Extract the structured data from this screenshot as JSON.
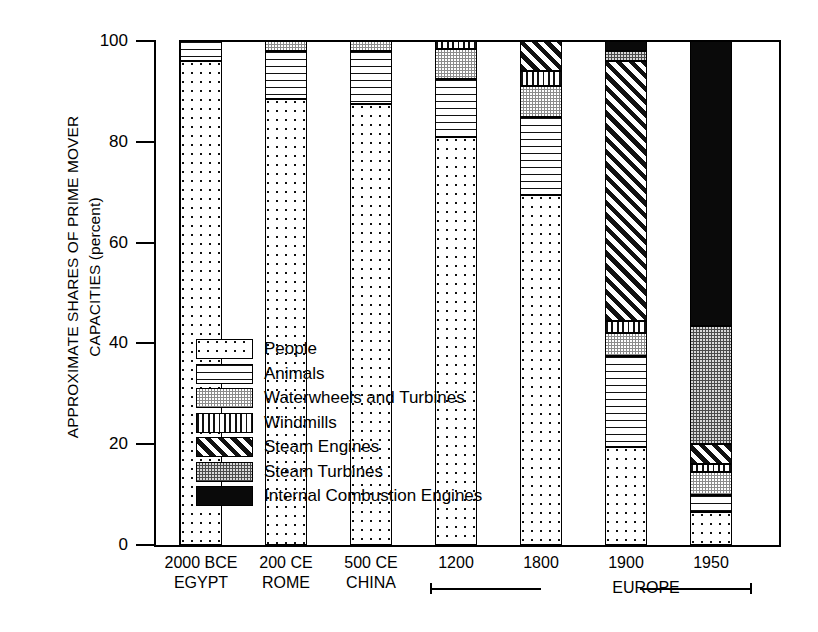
{
  "chart_data": {
    "type": "bar",
    "title": "",
    "subtype": "stacked-bar-100-percent",
    "ylabel_line1": "APPROXIMATE SHARES OF PRIME MOVER",
    "ylabel_line2": "CAPACITIES (percent)",
    "xlabel": "",
    "ylim": [
      0,
      100
    ],
    "yticks": [
      "0",
      "20",
      "40",
      "60",
      "80",
      "100"
    ],
    "grid": false,
    "legend_position": "inside-left-middle",
    "categories": [
      {
        "line1": "2000 BCE",
        "line2": "EGYPT"
      },
      {
        "line1": "200 CE",
        "line2": "ROME"
      },
      {
        "line1": "500 CE",
        "line2": "CHINA"
      },
      {
        "line1": "1200",
        "line2": ""
      },
      {
        "line1": "1800",
        "line2": ""
      },
      {
        "line1": "1900",
        "line2": ""
      },
      {
        "line1": "1950",
        "line2": ""
      }
    ],
    "group_annotation": "EUROPE",
    "group_annotation_covers": [
      "1200",
      "1800",
      "1900",
      "1950"
    ],
    "series": [
      {
        "name": "People",
        "pattern": "dots-sparse",
        "values": [
          96.0,
          88.5,
          87.5,
          81.0,
          69.5,
          19.5,
          6.5
        ]
      },
      {
        "name": "Animals",
        "pattern": "horizontal-lines",
        "values": [
          4.0,
          9.5,
          10.5,
          11.5,
          15.5,
          18.0,
          3.5
        ]
      },
      {
        "name": "Waterwheels and Turbines",
        "pattern": "gray-stipple",
        "values": [
          0.0,
          2.0,
          2.0,
          6.0,
          6.0,
          4.5,
          4.5
        ]
      },
      {
        "name": "Windmills",
        "pattern": "vertical-lines",
        "values": [
          0.0,
          0.0,
          0.0,
          1.5,
          3.0,
          2.5,
          1.5
        ]
      },
      {
        "name": "Steam Engines",
        "pattern": "diagonal-hatch",
        "values": [
          0.0,
          0.0,
          0.0,
          0.0,
          6.0,
          51.5,
          4.0
        ]
      },
      {
        "name": "Steam Turbines",
        "pattern": "dark-stipple",
        "values": [
          0.0,
          0.0,
          0.0,
          0.0,
          0.0,
          2.0,
          23.5
        ]
      },
      {
        "name": "Internal Combustion Engines",
        "pattern": "solid-black",
        "values": [
          0.0,
          0.0,
          0.0,
          0.0,
          0.0,
          2.0,
          56.5
        ]
      }
    ]
  },
  "legend": {
    "items": [
      {
        "label": "People"
      },
      {
        "label": "Animals"
      },
      {
        "label": "Waterwheels and Turbines"
      },
      {
        "label": "Windmills"
      },
      {
        "label": "Steam Engines"
      },
      {
        "label": "Steam Turbines"
      },
      {
        "label": "Internal Combustion Engines"
      }
    ]
  },
  "colors": {
    "ink": "#000000",
    "background": "#ffffff",
    "waterwheel_gray": "#8c8c8c",
    "steam_turbine_gray": "#4a4a4a",
    "internal_combustion_black": "#0a0a0a"
  }
}
